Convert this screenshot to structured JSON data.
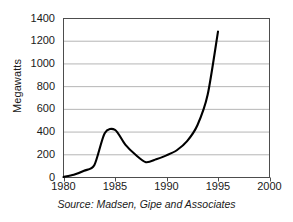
{
  "chart_data": {
    "type": "line",
    "title": "",
    "subtitle": "",
    "xlabel": "",
    "ylabel": "Megawatts",
    "source_note": "Source: Madsen, Gipe and Associates",
    "xlim": [
      1980,
      2000
    ],
    "ylim": [
      0,
      1400
    ],
    "xticks": [
      1980,
      1985,
      1990,
      1995,
      2000
    ],
    "xtick_labels": [
      "1980",
      "1985",
      "1990",
      "1995",
      "2000"
    ],
    "yticks": [
      0,
      200,
      400,
      600,
      800,
      1000,
      1200,
      1400
    ],
    "ytick_labels": [
      "0",
      "200",
      "400",
      "600",
      "800",
      "1000",
      "1200",
      "1400"
    ],
    "grid": "horizontal",
    "legend": "none",
    "line_color": "#000000",
    "line_width": 2.1,
    "series": [
      {
        "name": "Installed wind capacity",
        "x": [
          1980,
          1981,
          1982,
          1983,
          1984,
          1985,
          1986,
          1987,
          1988,
          1989,
          1990,
          1991,
          1992,
          1993,
          1994,
          1995
        ],
        "values": [
          5,
          25,
          60,
          110,
          390,
          420,
          290,
          200,
          135,
          160,
          195,
          240,
          320,
          460,
          730,
          1285
        ]
      }
    ]
  },
  "axis": {
    "y_title": "Megawatts"
  },
  "caption": {
    "text": "Source: Madsen, Gipe and Associates"
  }
}
